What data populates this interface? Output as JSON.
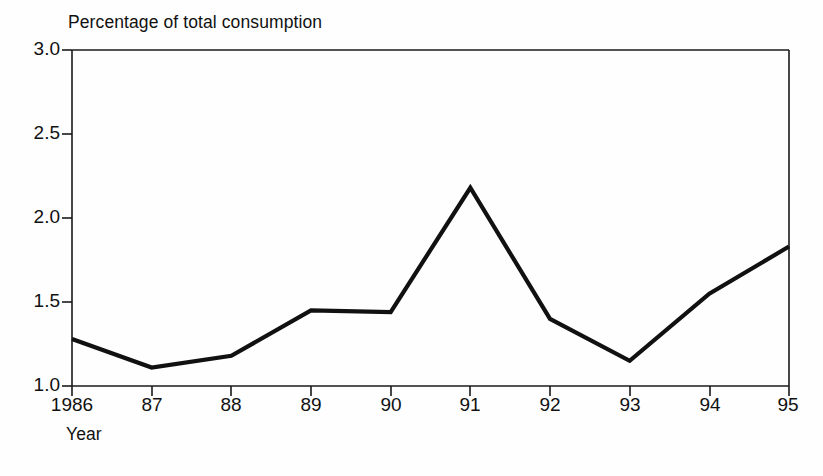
{
  "chart_data": {
    "type": "line",
    "title": "Percentage of total consumption",
    "xlabel": "Year",
    "ylabel": "",
    "categories": [
      "1986",
      "87",
      "88",
      "89",
      "90",
      "91",
      "92",
      "93",
      "94",
      "95"
    ],
    "x": [
      1986,
      1987,
      1988,
      1989,
      1990,
      1991,
      1992,
      1993,
      1994,
      1995
    ],
    "values": [
      1.28,
      1.11,
      1.18,
      1.45,
      1.44,
      2.18,
      1.4,
      1.15,
      1.55,
      1.83
    ],
    "series": [
      {
        "name": "Percentage of total consumption",
        "values": [
          1.28,
          1.11,
          1.18,
          1.45,
          1.44,
          2.18,
          1.4,
          1.15,
          1.55,
          1.83
        ]
      }
    ],
    "ylim": [
      1.0,
      3.0
    ],
    "xlim": [
      1986,
      1995
    ],
    "y_ticks": [
      "1.0",
      "1.5",
      "2.0",
      "2.5",
      "3.0"
    ],
    "y_tick_values": [
      1.0,
      1.5,
      2.0,
      2.5,
      3.0
    ],
    "x_ticks": [
      "1986",
      "87",
      "88",
      "89",
      "90",
      "91",
      "92",
      "93",
      "94",
      "95"
    ],
    "grid": false,
    "legend": "none",
    "line_color": "#111111",
    "axis_color": "#1a1a1a",
    "background_color": "#fefefe"
  },
  "figure": {
    "title_text": "Percentage of total consumption",
    "x_axis_caption": "Year"
  }
}
